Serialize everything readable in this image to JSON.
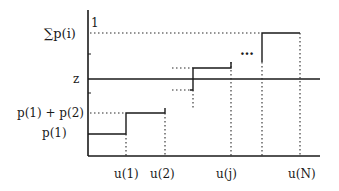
{
  "diagram": {
    "type": "cumulative step function (inverse-CDF sampling)",
    "y_labels": {
      "sum": "∑p(i)",
      "one": "1",
      "z": "z",
      "p1p2": "p(1) + p(2)",
      "p1": "p(1)"
    },
    "x_labels": {
      "u1": "u(1)",
      "u2": "u(2)",
      "uj": "u(j)",
      "uN": "u(N)"
    },
    "ellipsis": "…",
    "colors": {
      "ink": "#1a1a1a",
      "background": "#ffffff"
    }
  }
}
